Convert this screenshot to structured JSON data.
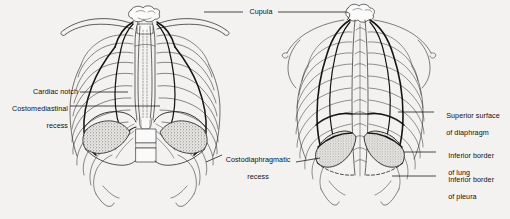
{
  "figure": {
    "type": "anatomical-illustration",
    "views": [
      {
        "id": "anterior",
        "name": "Anterior view of thorax"
      },
      {
        "id": "posterior",
        "name": "Posterior view of thorax"
      }
    ],
    "background_color": "#f3f2f0",
    "ink_color": "#1a1a1a",
    "stipple_color": "#6f6f6f"
  },
  "labels": {
    "cupula": "Cupula",
    "cardiac_notch": "Cardiac notch",
    "costomediastinal_recess_line1": "Costomediastinal",
    "costomediastinal_recess_line2": "recess",
    "costodiaphragmatic_recess_line1": "Costodiaphragmatic",
    "costodiaphragmatic_recess_line2": "recess",
    "superior_surface_diaphragm_line1": "Superior surface",
    "superior_surface_diaphragm_line2": "of diaphragm",
    "inferior_border_lung_line1": "Inferior border",
    "inferior_border_lung_line2": "of lung",
    "inferior_border_pleura_line1": "Inferior border",
    "inferior_border_pleura_line2": "of pleura"
  },
  "structures": {
    "clavicle": "clavicle",
    "sternum": "sternum",
    "ribs": "ribs",
    "vertebral_bodies": "vertebral bodies",
    "scapula": "scapula",
    "pleural_reflection": "pleural reflection",
    "lung_outline": "lung outline",
    "diaphragm": "diaphragm"
  }
}
